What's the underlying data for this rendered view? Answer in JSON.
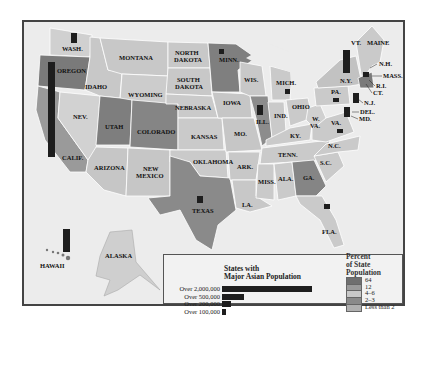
{
  "map": {
    "title": "States with Major Asian Population",
    "states": {
      "wash": "WASH.",
      "oregon": "OREGON",
      "calif": "CALIF.",
      "nev": "NEV.",
      "idaho": "IDAHO",
      "montana": "MONTANA",
      "wyoming": "WYOMING",
      "utah": "UTAH",
      "colorado": "COLORADO",
      "arizona": "ARIZONA",
      "new_mexico_1": "NEW",
      "new_mexico_2": "MEXICO",
      "north_dakota_1": "NORTH",
      "north_dakota_2": "DAKOTA",
      "south_dakota_1": "SOUTH",
      "south_dakota_2": "DAKOTA",
      "nebraska": "NEBRASKA",
      "kansas": "KANSAS",
      "oklahoma": "OKLAHOMA",
      "texas": "TEXAS",
      "minn": "MINN.",
      "iowa": "IOWA",
      "mo": "MO.",
      "ark": "ARK.",
      "la": "LA.",
      "wis": "WIS.",
      "ill": "ILL.",
      "mich": "MICH.",
      "ind": "IND.",
      "ohio": "OHIO",
      "ky": "KY.",
      "tenn": "TENN.",
      "miss": "MISS.",
      "ala": "ALA.",
      "ga": "GA.",
      "fla": "FLA.",
      "sc": "S.C.",
      "nc": "N.C.",
      "va": "VA.",
      "wva_1": "W.",
      "wva_2": "VA.",
      "pa": "PA.",
      "ny": "N.Y.",
      "vt": "VT.",
      "maine": "MAINE",
      "nh": "N.H.",
      "mass": "MASS.",
      "ri": "R.I.",
      "ct": "CT.",
      "nj": "N.J.",
      "del": "DEL.",
      "md": "MD.",
      "alaska": "ALASKA",
      "hawaii": "HAWAII"
    }
  },
  "legend": {
    "bars_title_1": "States with",
    "bars_title_2": "Major Asian Population",
    "bars": [
      {
        "label": "Over 2,000,000",
        "width": 90
      },
      {
        "label": "Over 500,000",
        "width": 22
      },
      {
        "label": "Over 200,000",
        "width": 9
      },
      {
        "label": "Over 100,000",
        "width": 4
      }
    ],
    "percent_title_1": "Percent",
    "percent_title_2": "of State",
    "percent_title_3": "Population",
    "swatches": [
      {
        "label": "64",
        "color": "#6f6f6f"
      },
      {
        "label": "12",
        "color": "#9a9a9a"
      },
      {
        "label": "4–6",
        "color": "#c8c8c8"
      },
      {
        "label": "2–3",
        "color": "#8a8a8a"
      },
      {
        "label": "Less than 2",
        "color": "#b0b0b0"
      }
    ]
  },
  "colors": {
    "dark": "#7a7a7a",
    "mid": "#a8a8a8",
    "light": "#c9c9c9",
    "lighter": "#d6d6d6",
    "water": "#ececec",
    "bar": "#1e1e1e"
  }
}
